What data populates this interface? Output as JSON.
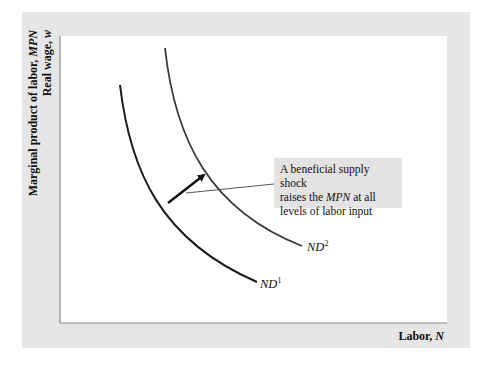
{
  "diagram": {
    "title": "",
    "y_axis_label_line1": "Marginal product of labor, ",
    "y_axis_label_line1_var": "MPN",
    "y_axis_label_line2": "Real wage, ",
    "y_axis_label_line2_var": "w",
    "x_axis_label": "Labor, ",
    "x_axis_label_var": "N",
    "curves": [
      {
        "name": "ND",
        "superscript": "1",
        "color": "#1a1a1a"
      },
      {
        "name": "ND",
        "superscript": "2",
        "color": "#3a3a3a"
      }
    ],
    "annotation": {
      "line1": "A beneficial supply shock",
      "line2_pre": "raises the ",
      "line2_var": "MPN",
      "line2_post": " at all",
      "line3": "levels of labor input"
    },
    "colors": {
      "panel_background": "#e6e6e6",
      "plot_background": "#ffffff",
      "axis": "#888888",
      "callout_background": "#e3e3e3"
    }
  }
}
